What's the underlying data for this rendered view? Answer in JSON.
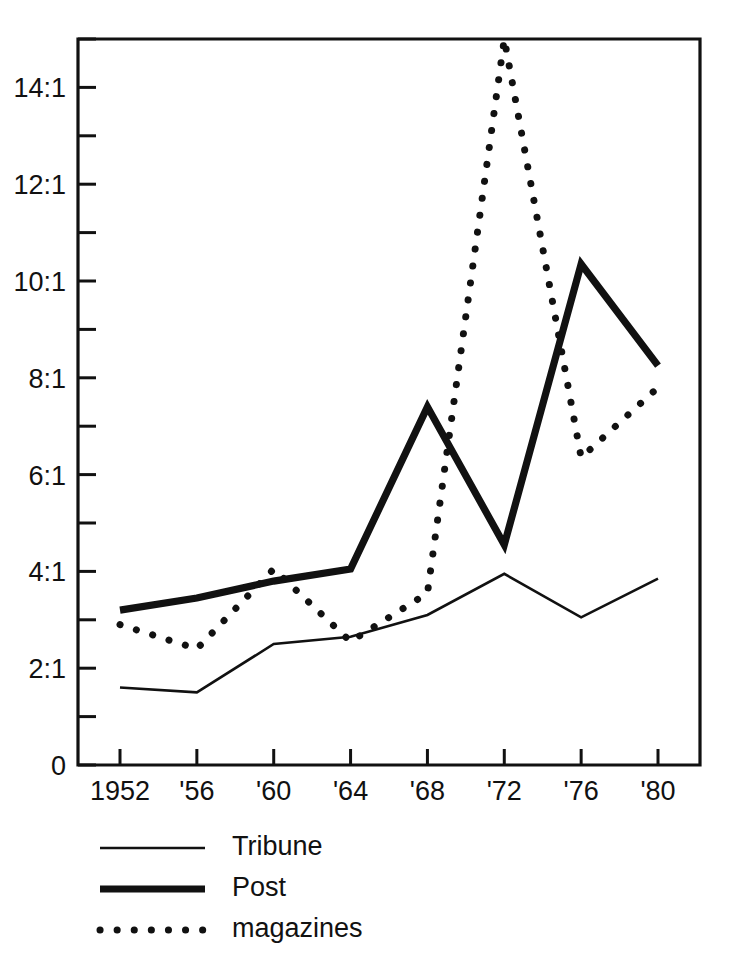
{
  "chart_data": {
    "type": "line",
    "title": "",
    "subtitle": "",
    "xlabel": "",
    "ylabel": "",
    "x": [
      1952,
      1956,
      1960,
      1964,
      1968,
      1972,
      1976,
      1980
    ],
    "categories": [
      "1952",
      "'56",
      "'60",
      "'64",
      "'68",
      "'72",
      "'76",
      "'80"
    ],
    "xtick_labels": [
      "1952",
      "'56",
      "'60",
      "'64",
      "'68",
      "'72",
      "'76",
      "'80"
    ],
    "ytick_labels": [
      "0",
      "2:1",
      "4:1",
      "6:1",
      "8:1",
      "10:1",
      "12:1",
      "14:1"
    ],
    "ytick_values": [
      0,
      2,
      4,
      6,
      8,
      10,
      12,
      14
    ],
    "yminor_values": [
      1,
      3,
      5,
      7,
      9,
      11,
      13,
      15
    ],
    "ylim": [
      0,
      15
    ],
    "xlim": [
      1950,
      1982
    ],
    "grid": false,
    "legend_position": "below-left",
    "series": [
      {
        "name": "Tribune",
        "style": "thin-solid",
        "color": "#111111",
        "values": [
          1.6,
          1.5,
          2.5,
          2.65,
          3.1,
          3.95,
          3.05,
          3.85
        ]
      },
      {
        "name": "Post",
        "style": "thick-solid",
        "color": "#111111",
        "values": [
          3.2,
          3.45,
          3.8,
          4.05,
          7.4,
          4.55,
          10.35,
          8.25
        ]
      },
      {
        "name": "magazines",
        "style": "dotted",
        "color": "#111111",
        "values": [
          2.9,
          2.4,
          4.05,
          2.55,
          3.55,
          15.0,
          6.35,
          7.8
        ]
      }
    ],
    "annotations": []
  },
  "legend": {
    "items": [
      {
        "label": "Tribune",
        "style": "thin-solid"
      },
      {
        "label": "Post",
        "style": "thick-solid"
      },
      {
        "label": "magazines",
        "style": "dotted"
      }
    ]
  },
  "axes": {
    "y_zero_label": "0"
  },
  "colors": {
    "ink": "#111111",
    "background": "#ffffff"
  }
}
